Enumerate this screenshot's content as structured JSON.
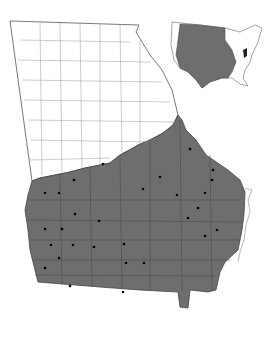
{
  "map": {
    "subject": "Georgia county distribution map",
    "colors": {
      "shaded": "#6e6e6e",
      "unshaded": "#ffffff",
      "border": "#444444",
      "dot": "#000000"
    },
    "inset": {
      "subject": "United States distribution inset"
    },
    "dots": [
      [
        12,
        181
      ],
      [
        46,
        189
      ],
      [
        60,
        193
      ],
      [
        74,
        180
      ],
      [
        103,
        190
      ],
      [
        143,
        180
      ],
      [
        177,
        180
      ],
      [
        190,
        178
      ],
      [
        212,
        180
      ],
      [
        207,
        192
      ],
      [
        45,
        193
      ],
      [
        59,
        193
      ],
      [
        75,
        214
      ],
      [
        99,
        221
      ],
      [
        145,
        189
      ],
      [
        182,
        203
      ],
      [
        213,
        190
      ],
      [
        45,
        229
      ],
      [
        62,
        229
      ],
      [
        51,
        245
      ],
      [
        73,
        245
      ],
      [
        94,
        247
      ],
      [
        124,
        244
      ],
      [
        188,
        221
      ],
      [
        198,
        209
      ],
      [
        217,
        230
      ],
      [
        205,
        236
      ],
      [
        59,
        258
      ],
      [
        126,
        263
      ],
      [
        144,
        263
      ],
      [
        45,
        268
      ],
      [
        70,
        286
      ],
      [
        123,
        292
      ]
    ]
  }
}
